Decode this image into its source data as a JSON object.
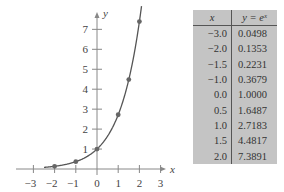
{
  "chart_data": {
    "type": "line",
    "title": "",
    "function": "y = e^x",
    "xlabel": "x",
    "ylabel": "y",
    "xlim": [
      -3.5,
      3.5
    ],
    "ylim": [
      0,
      7.8
    ],
    "x_ticks": [
      -3,
      -2,
      -1,
      0,
      1,
      2,
      3
    ],
    "y_ticks": [
      1,
      2,
      3,
      4,
      5,
      6,
      7
    ],
    "grid": false,
    "points": [
      {
        "x": -2.0,
        "y": 0.1353
      },
      {
        "x": -1.0,
        "y": 0.3679
      },
      {
        "x": 0.0,
        "y": 1.0
      },
      {
        "x": 1.0,
        "y": 2.7183
      },
      {
        "x": 1.5,
        "y": 4.4817
      },
      {
        "x": 2.0,
        "y": 7.3891
      }
    ],
    "table": {
      "headers": [
        "x",
        "y = eˣ"
      ],
      "rows": [
        [
          "−3.0",
          "0.0498"
        ],
        [
          "−2.0",
          "0.1353"
        ],
        [
          "−1.5",
          "0.2231"
        ],
        [
          "−1.0",
          "0.3679"
        ],
        [
          "0.0",
          "1.0000"
        ],
        [
          "0.5",
          "1.6487"
        ],
        [
          "1.0",
          "2.7183"
        ],
        [
          "1.5",
          "4.4817"
        ],
        [
          "2.0",
          "7.3891"
        ]
      ]
    }
  },
  "axis_labels": {
    "x": "x",
    "y": "y"
  },
  "x_tick_labels": [
    "−3",
    "−2",
    "−1",
    "0",
    "1",
    "2",
    "3"
  ],
  "y_tick_labels": [
    "1",
    "2",
    "3",
    "4",
    "5",
    "6",
    "7"
  ],
  "colors": {
    "curve": "#555555",
    "point": "#666666",
    "axis": "#888888",
    "table_bg": "#c4c4c4"
  }
}
